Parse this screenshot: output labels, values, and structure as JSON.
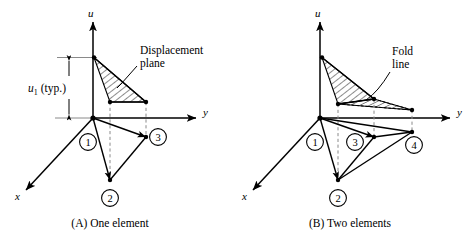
{
  "figure": {
    "panels": [
      {
        "id": "panel-a",
        "caption": "(A)  One element",
        "axes": {
          "u": "u",
          "y": "y",
          "x": "x"
        },
        "annotation": {
          "line1": "Displacement",
          "line2": "plane"
        },
        "dimension": {
          "symbol": "u",
          "subscript": "1",
          "note": "(typ.)"
        },
        "nodes": [
          {
            "label": "1"
          },
          {
            "label": "2"
          },
          {
            "label": "3"
          }
        ],
        "hatched_regions": 1
      },
      {
        "id": "panel-b",
        "caption": "(B)  Two elements",
        "axes": {
          "u": "u",
          "y": "y",
          "x": "x"
        },
        "annotation": {
          "line1": "Fold",
          "line2": "line"
        },
        "nodes": [
          {
            "label": "1"
          },
          {
            "label": "2"
          },
          {
            "label": "3"
          },
          {
            "label": "4"
          }
        ],
        "hatched_regions": 2
      }
    ],
    "colors": {
      "ink": "#000000",
      "dashed": "#8a8a8a",
      "background": "#ffffff"
    }
  }
}
